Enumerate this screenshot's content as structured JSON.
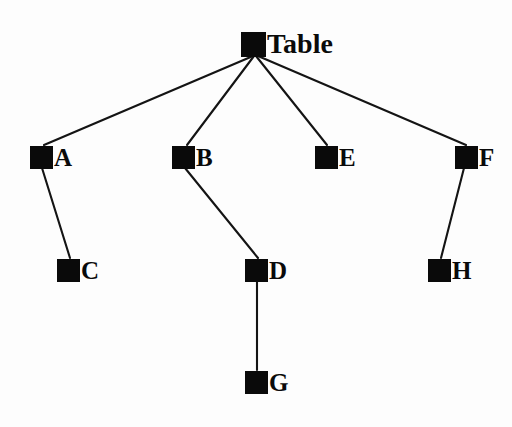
{
  "diagram": {
    "type": "tree",
    "background_color": "#fdfdfd",
    "node_color": "#0a0a0a",
    "edge_color": "#141414",
    "canvas": {
      "width": 512,
      "height": 427
    },
    "nodes": [
      {
        "id": "Table",
        "label": "Table",
        "x": 241,
        "y": 30,
        "size": 25,
        "label_size": "lg",
        "level": 0,
        "parent": null
      },
      {
        "id": "A",
        "label": "A",
        "x": 30,
        "y": 145,
        "size": 23,
        "label_size": "sm",
        "level": 1,
        "parent": "Table"
      },
      {
        "id": "B",
        "label": "B",
        "x": 172,
        "y": 145,
        "size": 23,
        "label_size": "sm",
        "level": 1,
        "parent": "Table"
      },
      {
        "id": "E",
        "label": "E",
        "x": 315,
        "y": 145,
        "size": 23,
        "label_size": "sm",
        "level": 1,
        "parent": "Table"
      },
      {
        "id": "F",
        "label": "F",
        "x": 455,
        "y": 145,
        "size": 23,
        "label_size": "sm",
        "level": 1,
        "parent": "Table"
      },
      {
        "id": "C",
        "label": "C",
        "x": 57,
        "y": 258,
        "size": 23,
        "label_size": "sm",
        "level": 2,
        "parent": "A"
      },
      {
        "id": "D",
        "label": "D",
        "x": 245,
        "y": 258,
        "size": 23,
        "label_size": "sm",
        "level": 2,
        "parent": "B"
      },
      {
        "id": "H",
        "label": "H",
        "x": 428,
        "y": 258,
        "size": 23,
        "label_size": "sm",
        "level": 2,
        "parent": "F"
      },
      {
        "id": "G",
        "label": "G",
        "x": 245,
        "y": 370,
        "size": 23,
        "label_size": "sm",
        "level": 3,
        "parent": "D"
      }
    ],
    "edges": [
      {
        "from": "Table",
        "to": "A",
        "x1": 253,
        "y1": 56,
        "x2": 44,
        "y2": 145
      },
      {
        "from": "Table",
        "to": "B",
        "x1": 254,
        "y1": 56,
        "x2": 187,
        "y2": 145
      },
      {
        "from": "Table",
        "to": "E",
        "x1": 256,
        "y1": 56,
        "x2": 327,
        "y2": 145
      },
      {
        "from": "Table",
        "to": "F",
        "x1": 258,
        "y1": 56,
        "x2": 466,
        "y2": 145
      },
      {
        "from": "A",
        "to": "C",
        "x1": 42,
        "y1": 168,
        "x2": 70,
        "y2": 258
      },
      {
        "from": "B",
        "to": "D",
        "x1": 185,
        "y1": 168,
        "x2": 258,
        "y2": 258
      },
      {
        "from": "F",
        "to": "H",
        "x1": 464,
        "y1": 168,
        "x2": 441,
        "y2": 258
      },
      {
        "from": "D",
        "to": "G",
        "x1": 257,
        "y1": 281,
        "x2": 257,
        "y2": 370
      }
    ]
  }
}
